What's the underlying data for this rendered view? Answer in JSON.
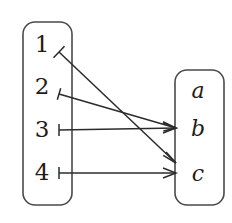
{
  "figure": {
    "type": "function-mapping-diagram",
    "width": 232,
    "height": 223,
    "background_color": "#ffffff",
    "stroke_color": "#2b2b2b",
    "box_stroke_color": "#4a4a4a"
  },
  "domain_set": {
    "name": "domain-set",
    "box": {
      "x": 23,
      "y": 22,
      "width": 49,
      "height": 183,
      "corner_radius": 12
    },
    "elements": [
      {
        "id": "n1",
        "label": "1",
        "x": 42,
        "y": 45
      },
      {
        "id": "n2",
        "label": "2",
        "x": 42,
        "y": 87
      },
      {
        "id": "n3",
        "label": "3",
        "x": 42,
        "y": 130
      },
      {
        "id": "n4",
        "label": "4",
        "x": 42,
        "y": 173
      }
    ]
  },
  "codomain_set": {
    "name": "codomain-set",
    "box": {
      "x": 175,
      "y": 70,
      "width": 49,
      "height": 135,
      "corner_radius": 12
    },
    "elements": [
      {
        "id": "a",
        "label": "a",
        "x": 198,
        "y": 90
      },
      {
        "id": "b",
        "label": "b",
        "x": 198,
        "y": 128
      },
      {
        "id": "c",
        "label": "c",
        "x": 198,
        "y": 173
      }
    ]
  },
  "mappings": [
    {
      "id": "map-1",
      "from": "1",
      "to": "c-region",
      "tail": [
        59,
        52
      ],
      "head": [
        176,
        163
      ],
      "tail_bar_style": "perpendicular"
    },
    {
      "id": "map-2",
      "from": "2",
      "to": "b",
      "tail": [
        59,
        94
      ],
      "head": [
        176,
        128
      ],
      "tail_bar_style": "perpendicular"
    },
    {
      "id": "map-3",
      "from": "3",
      "to": "b",
      "tail": [
        59,
        130
      ],
      "head": [
        176,
        128
      ],
      "tail_bar_style": "perpendicular"
    },
    {
      "id": "map-4",
      "from": "4",
      "to": "c",
      "tail": [
        59,
        173
      ],
      "head": [
        176,
        173
      ],
      "tail_bar_style": "perpendicular"
    }
  ],
  "crossing_point": {
    "x": 122,
    "y": 105
  }
}
